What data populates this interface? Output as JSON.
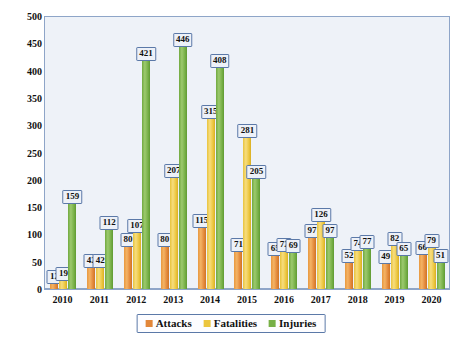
{
  "chart_data": {
    "type": "bar",
    "title": "",
    "xlabel": "",
    "ylabel": "",
    "ylim": [
      0,
      500
    ],
    "ytick_step": 50,
    "grid": false,
    "legend_position": "bottom",
    "categories": [
      "2010",
      "2011",
      "2012",
      "2013",
      "2014",
      "2015",
      "2016",
      "2017",
      "2018",
      "2019",
      "2020"
    ],
    "ytick_labels": [
      "0",
      "50",
      "100",
      "150",
      "200",
      "250",
      "300",
      "350",
      "400",
      "450",
      "500"
    ],
    "series": [
      {
        "name": "Attacks",
        "color": "#e2873a",
        "values": [
          12,
          42,
          80,
          80,
          115,
          71,
          65,
          97,
          52,
          49,
          66
        ]
      },
      {
        "name": "Fatalities",
        "color": "#ecc63f",
        "values": [
          19,
          42,
          107,
          207,
          315,
          281,
          72,
          126,
          74,
          82,
          79
        ]
      },
      {
        "name": "Injuries",
        "color": "#77b047",
        "values": [
          159,
          112,
          421,
          446,
          408,
          205,
          69,
          97,
          77,
          65,
          51
        ]
      }
    ]
  },
  "legend": {
    "items": [
      {
        "label": "Attacks",
        "swatch": "legend-swatch-attacks"
      },
      {
        "label": "Fatalities",
        "swatch": "legend-swatch-fatalities"
      },
      {
        "label": "Injuries",
        "swatch": "legend-swatch-injuries"
      }
    ]
  }
}
